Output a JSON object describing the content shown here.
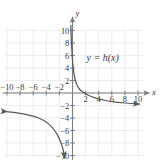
{
  "figure": {
    "name": "rational-function-graph",
    "background_color": "#ffffff",
    "grid_color": "#e8e8e8",
    "axis_color": "#7d7d7d",
    "curve_color": "#595959",
    "text_color": "#3a3a3a"
  },
  "labels": {
    "x_axis_name": "x",
    "y_axis_name": "y",
    "function_label": "y = h(x)"
  },
  "chart_data": {
    "type": "line",
    "title": "",
    "subtitle": "",
    "xlabel": "x",
    "ylabel": "y",
    "xlim": [
      -11,
      11
    ],
    "ylim": [
      -11,
      11
    ],
    "grid": true,
    "grid_step": 2,
    "legend_position": "inside-upper-right",
    "annotations": [
      {
        "text": "y = h(x)",
        "x": 4.6,
        "y": 5.2
      }
    ],
    "x_ticks": [
      -10,
      -8,
      -6,
      -4,
      -2,
      2,
      4,
      6,
      8,
      10
    ],
    "x_tick_labels": [
      "−10",
      "−8",
      "−6",
      "−4",
      "−2",
      "2",
      "4",
      "6",
      "8",
      "10"
    ],
    "y_ticks": [
      10,
      8,
      6,
      4,
      2,
      -2,
      -4,
      -6,
      -8,
      -10
    ],
    "y_tick_labels": [
      "10",
      "8",
      "6",
      "4",
      "2",
      "−2",
      "−4",
      "−6",
      "−8",
      "−10"
    ],
    "asymptotes": [
      {
        "kind": "vertical",
        "value": -0.35
      },
      {
        "kind": "horizontal",
        "value": -2
      }
    ],
    "x_intercept": 2.0,
    "series": [
      {
        "name": "h(x) right branch",
        "arrow_end": "right",
        "points": [
          [
            -0.25,
            10.8
          ],
          [
            -0.2,
            9.0
          ],
          [
            -0.1,
            7.0
          ],
          [
            0.0,
            5.2
          ],
          [
            0.15,
            3.6
          ],
          [
            0.35,
            2.4
          ],
          [
            0.6,
            1.5
          ],
          [
            0.9,
            0.85
          ],
          [
            1.3,
            0.35
          ],
          [
            1.7,
            0.1
          ],
          [
            2.0,
            -0.1
          ],
          [
            2.6,
            -0.45
          ],
          [
            3.2,
            -0.7
          ],
          [
            4.0,
            -0.95
          ],
          [
            5.0,
            -1.2
          ],
          [
            6.0,
            -1.38
          ],
          [
            7.0,
            -1.5
          ],
          [
            8.0,
            -1.6
          ],
          [
            9.0,
            -1.68
          ],
          [
            10.2,
            -1.76
          ]
        ]
      },
      {
        "name": "h(x) left branch",
        "arrow_end": "both",
        "points": [
          [
            -10.0,
            -3.0
          ],
          [
            -9.0,
            -3.1
          ],
          [
            -8.0,
            -3.25
          ],
          [
            -7.0,
            -3.45
          ],
          [
            -6.0,
            -3.7
          ],
          [
            -5.2,
            -4.0
          ],
          [
            -4.4,
            -4.4
          ],
          [
            -3.7,
            -4.9
          ],
          [
            -3.1,
            -5.5
          ],
          [
            -2.6,
            -6.2
          ],
          [
            -2.2,
            -6.9
          ],
          [
            -1.9,
            -7.6
          ],
          [
            -1.65,
            -8.3
          ],
          [
            -1.45,
            -9.0
          ],
          [
            -1.3,
            -9.7
          ],
          [
            -1.2,
            -10.4
          ]
        ]
      }
    ]
  }
}
